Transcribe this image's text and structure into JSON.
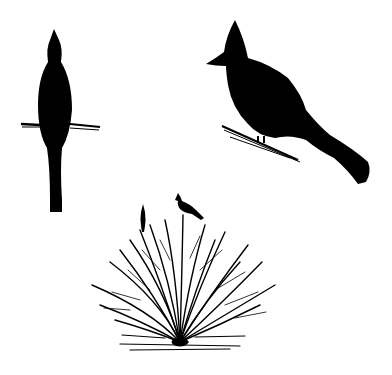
{
  "illustration": {
    "background": "#ffffff",
    "ink": "#000000",
    "figures": [
      {
        "name": "bird-front-view",
        "description": "Bird silhouette seen from front, perched on a twig"
      },
      {
        "name": "bird-side-view",
        "description": "Crested bird silhouette in profile, perched on a branch"
      },
      {
        "name": "bush-with-birds",
        "description": "Leafless shrub with two small bird silhouettes on top"
      }
    ]
  }
}
